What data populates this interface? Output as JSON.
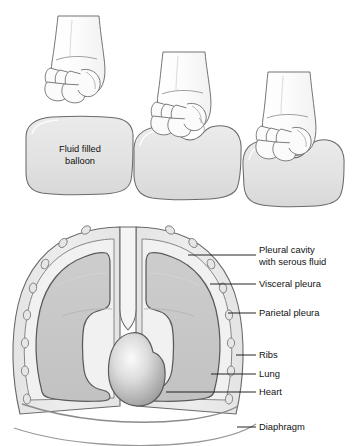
{
  "figure": {
    "balloon_label_line1": "Fluid filled",
    "balloon_label_line2": "balloon"
  },
  "panels": [
    {
      "name": "panel-1",
      "caption": "Fist above undeformed balloon"
    },
    {
      "name": "panel-2",
      "caption": "Fist partially pressed into balloon"
    },
    {
      "name": "panel-3",
      "caption": "Fist deeply pressed into balloon"
    }
  ],
  "anatomy_labels": [
    {
      "id": "pleural-cavity",
      "line1": "Pleural cavity",
      "line2": "with serous fluid"
    },
    {
      "id": "visceral-pleura",
      "line1": "Visceral pleura",
      "line2": ""
    },
    {
      "id": "parietal-pleura",
      "line1": "Parietal pleura",
      "line2": ""
    },
    {
      "id": "ribs",
      "line1": "Ribs",
      "line2": ""
    },
    {
      "id": "lung",
      "line1": "Lung",
      "line2": ""
    },
    {
      "id": "heart",
      "line1": "Heart",
      "line2": ""
    },
    {
      "id": "diaphragm",
      "line1": "Diaphragm",
      "line2": ""
    }
  ],
  "colors": {
    "outline": "#5a5a5a",
    "outline_dark": "#4a4a4a",
    "balloon_fill": "#e2e2e2",
    "chest_wall_fill": "#e8e8e8",
    "pleural_cavity_fill": "#eeeeee",
    "lung_fill": "#c9c9c9",
    "heart_light": "#f2f2f2",
    "heart_dark": "#9a9a9a",
    "rib_fill": "#e0e0e0",
    "skin_fill": "#fbfbfb",
    "leader_line": "#1a1a1a",
    "text": "#111111",
    "background": "#ffffff"
  }
}
